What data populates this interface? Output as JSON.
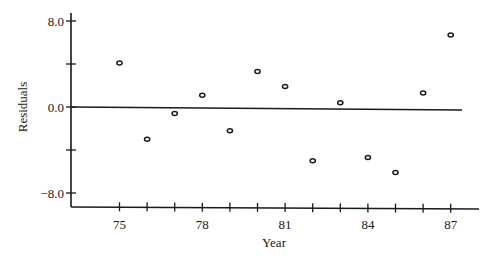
{
  "chart_data": {
    "type": "scatter",
    "title": "",
    "xlabel": "Year",
    "ylabel": "Residuals",
    "x": [
      75,
      76,
      77,
      78,
      79,
      80,
      81,
      82,
      83,
      84,
      85,
      86,
      87
    ],
    "series": [
      {
        "name": "Residuals",
        "values": [
          4.1,
          -3.0,
          -0.6,
          1.1,
          -2.2,
          3.3,
          1.9,
          -5.0,
          0.4,
          -4.7,
          -6.1,
          1.3,
          6.7
        ]
      }
    ],
    "xlim": [
      73.2,
      88.0
    ],
    "ylim": [
      -9.3,
      9.3
    ],
    "x_ticks": [
      74,
      75,
      76,
      77,
      78,
      79,
      80,
      81,
      82,
      83,
      84,
      85,
      86,
      87
    ],
    "x_tick_labels": [
      "",
      "75",
      "",
      "",
      "78",
      "",
      "",
      "81",
      "",
      "",
      "84",
      "",
      "",
      "87"
    ],
    "y_ticks": [
      8.0,
      4.0,
      0.0,
      -4.0,
      -8.0
    ],
    "y_tick_labels": [
      "8.0",
      "",
      "0.0",
      "",
      "−8.0"
    ],
    "reference_line": {
      "y": 0.0,
      "description": "horizontal zero line"
    },
    "marker": "open-circle",
    "grid": false,
    "legend": null
  }
}
